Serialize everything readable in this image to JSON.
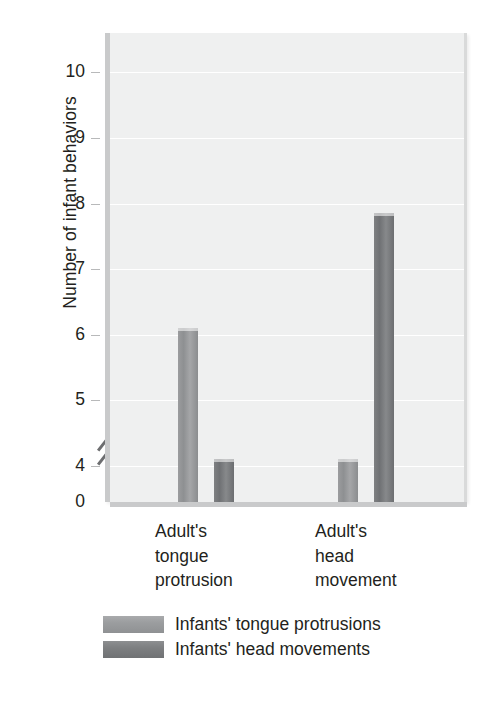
{
  "chart_data": {
    "type": "bar",
    "title": "",
    "subtitle": "",
    "xlabel": "",
    "ylabel": "Number of infant behaviors",
    "categories": [
      "Adult's\ntongue\nprotrusion",
      "Adult's\nhead\nmovement"
    ],
    "category_labels_flat": [
      "Adult's tongue protrusion",
      "Adult's head movement"
    ],
    "series": [
      {
        "name": "Infants' tongue protrusions",
        "color": "#9b9d9f",
        "values": [
          6.1,
          4.1
        ]
      },
      {
        "name": "Infants' head movements",
        "color": "#76787a",
        "values": [
          4.1,
          7.85
        ]
      }
    ],
    "y_ticks": [
      10,
      9,
      8,
      7,
      6,
      5,
      4,
      0
    ],
    "y_tick_labels": [
      "10",
      "9",
      "8",
      "7",
      "6",
      "5",
      "4",
      "0"
    ],
    "ylim": [
      3.45,
      10.6
    ],
    "axis_break": true,
    "axis_break_note": "y-axis broken between 0 and 4",
    "grid": true,
    "grid_axis": "y",
    "legend_position": "bottom-left",
    "plot_background": "#eff0f0",
    "gridline_color": "#ffffff",
    "text_color": "#231f20"
  },
  "legend": {
    "items": [
      {
        "label": "Infants' tongue protrusions"
      },
      {
        "label": "Infants' head movements"
      }
    ]
  },
  "y_axis": {
    "title": "Number of infant behaviors",
    "ticks": [
      {
        "label": "10"
      },
      {
        "label": "9"
      },
      {
        "label": "8"
      },
      {
        "label": "7"
      },
      {
        "label": "6"
      },
      {
        "label": "5"
      },
      {
        "label": "4"
      },
      {
        "label": "0"
      }
    ]
  },
  "x_axis": {
    "groups": [
      {
        "label": "Adult's\ntongue\nprotrusion"
      },
      {
        "label": "Adult's\nhead\nmovement"
      }
    ]
  }
}
